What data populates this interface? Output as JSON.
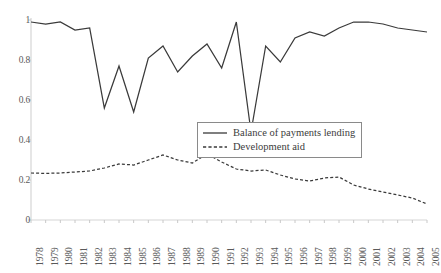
{
  "chart_data": {
    "type": "line",
    "title": "",
    "xlabel": "",
    "ylabel": "",
    "xlim": [
      1978,
      2005
    ],
    "ylim": [
      0,
      1
    ],
    "grid": false,
    "legend_position": "center-right",
    "x": [
      1978,
      1979,
      1980,
      1981,
      1982,
      1983,
      1984,
      1985,
      1986,
      1987,
      1988,
      1989,
      1990,
      1991,
      1992,
      1993,
      1994,
      1995,
      1996,
      1997,
      1998,
      1999,
      2000,
      2001,
      2002,
      2003,
      2004,
      2005
    ],
    "xticklabels": [
      "1978",
      "1979",
      "1980",
      "1981",
      "1982",
      "1983",
      "1984",
      "1985",
      "1986",
      "1987",
      "1988",
      "1989",
      "1990",
      "1991",
      "1992",
      "1993",
      "1994",
      "1995",
      "1996",
      "1997",
      "1998",
      "1999",
      "2000",
      "2001",
      "2002",
      "2003",
      "2004",
      "2005"
    ],
    "yticks": [
      0,
      0.2,
      0.4,
      0.6,
      0.8,
      1
    ],
    "yticklabels": [
      "0",
      "0.2",
      "0.4",
      "0.6",
      "0.8",
      "1"
    ],
    "series": [
      {
        "name": "Balance of payments lending",
        "style": "solid",
        "color": "#3a3a3a",
        "values": [
          0.99,
          0.98,
          0.99,
          0.95,
          0.96,
          0.56,
          0.77,
          0.54,
          0.81,
          0.87,
          0.74,
          0.82,
          0.88,
          0.76,
          0.99,
          0.44,
          0.87,
          0.79,
          0.91,
          0.94,
          0.92,
          0.96,
          0.99,
          0.99,
          0.98,
          0.96,
          0.95,
          0.94
        ]
      },
      {
        "name": "Development aid",
        "style": "dashed",
        "color": "#3a3a3a",
        "values": [
          0.235,
          0.233,
          0.235,
          0.24,
          0.245,
          0.26,
          0.28,
          0.275,
          0.3,
          0.325,
          0.3,
          0.285,
          0.33,
          0.29,
          0.255,
          0.245,
          0.25,
          0.225,
          0.205,
          0.195,
          0.21,
          0.215,
          0.175,
          0.155,
          0.14,
          0.125,
          0.11,
          0.08
        ]
      }
    ]
  },
  "legend": {
    "items": [
      {
        "label": "Balance of payments lending",
        "style": "solid"
      },
      {
        "label": "Development aid",
        "style": "dashed"
      }
    ]
  }
}
